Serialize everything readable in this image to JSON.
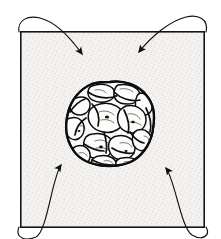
{
  "figure": {
    "title": "Lobulated mass within stippled square field with four converging arrows",
    "caption": "",
    "background_color": "#ffffff",
    "ink_color": "#111111"
  },
  "frame": {
    "name": "field-border",
    "x": 20,
    "y": 31,
    "width": 185,
    "height": 197,
    "fill_color": "#f2f1ef",
    "border_color": "#151515",
    "texture": "stipple"
  },
  "mass": {
    "name": "lobulated-mass",
    "label": "",
    "center_x": 110,
    "center_y": 123,
    "width": 86,
    "height": 84,
    "outline_color": "#0d0d0d",
    "fill_color": "#fbfbfa",
    "shading": "stipple-and-hatch",
    "lobe_count": 18
  },
  "arrows": [
    {
      "name": "arrow-top-left",
      "origin": "outside-top-left",
      "tip_x": 85,
      "tip_y": 58,
      "direction": "down-right",
      "color": "#111111"
    },
    {
      "name": "arrow-top-right",
      "origin": "outside-top-right",
      "tip_x": 136,
      "tip_y": 56,
      "direction": "down-left",
      "color": "#111111"
    },
    {
      "name": "arrow-bottom-left",
      "origin": "outside-bottom-left",
      "tip_x": 58,
      "tip_y": 161,
      "direction": "up-right",
      "color": "#111111"
    },
    {
      "name": "arrow-bottom-right",
      "origin": "outside-bottom-right",
      "tip_x": 163,
      "tip_y": 164,
      "direction": "up-left",
      "color": "#111111"
    }
  ]
}
